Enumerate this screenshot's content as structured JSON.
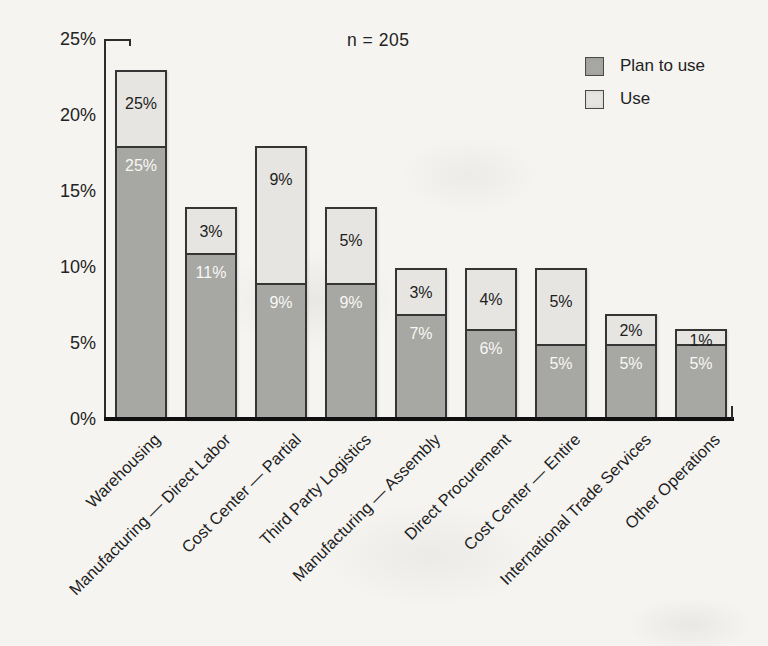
{
  "page": {
    "background_color": "#f5f4f1"
  },
  "chart_data": {
    "type": "bar",
    "stacked": true,
    "annotation": "n = 205",
    "categories": [
      "Warehousing",
      "Manufacturing — Direct Labor",
      "Cost Center — Partial",
      "Third Party Logistics",
      "Manufacturing — Assembly",
      "Direct Procurement",
      "Cost Center — Entire",
      "International Trade Services",
      "Other Operations"
    ],
    "series": [
      {
        "name": "Plan to use",
        "color": "#a7a7a3",
        "label_color": "#f8f8f5",
        "labels": [
          "25%",
          "11%",
          "9%",
          "9%",
          "7%",
          "6%",
          "5%",
          "5%",
          "5%"
        ],
        "drawn_values": [
          18,
          11,
          9,
          9,
          7,
          6,
          5,
          5,
          5
        ]
      },
      {
        "name": "Use",
        "color": "#e6e5e1",
        "label_color": "#1d1d1d",
        "labels": [
          "25%",
          "3%",
          "9%",
          "5%",
          "3%",
          "4%",
          "5%",
          "2%",
          "1%"
        ],
        "drawn_values": [
          5,
          3,
          9,
          5,
          3,
          4,
          5,
          2,
          1
        ]
      }
    ],
    "totals_drawn": [
      23,
      14,
      18,
      14,
      10,
      10,
      10,
      7,
      6
    ],
    "y_ticks": [
      "25%",
      "20%",
      "15%",
      "10%",
      "5%",
      "0%"
    ],
    "ylim": [
      0,
      25
    ],
    "grid": false,
    "legend_position": "top-right",
    "bar_border_color": "#353535",
    "axis_color": "#2c2c2c"
  }
}
